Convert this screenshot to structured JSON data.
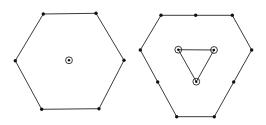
{
  "diagram": {
    "type": "graph-drawing",
    "colors": {
      "edge": "#3a3a3a",
      "vertex": "#111111",
      "background": "#ffffff"
    },
    "figures": [
      {
        "name": "hexagon-with-center",
        "outer_polygon": [
          [
            43.3,
            14
          ],
          [
            96,
            13.3
          ],
          [
            124,
            60.3
          ],
          [
            99,
            108.7
          ],
          [
            41.7,
            109.3
          ],
          [
            15.3,
            60.7
          ]
        ],
        "plain_vertices": [
          [
            43.3,
            14
          ],
          [
            96,
            13.3
          ],
          [
            124,
            60.3
          ],
          [
            99,
            108.7
          ],
          [
            41.7,
            109.3
          ],
          [
            15.3,
            60.7
          ]
        ],
        "ringed_vertices": [
          [
            69,
            60.3
          ]
        ],
        "inner_polygon": []
      },
      {
        "name": "hexagon-with-inner-triangle",
        "outer_polygon": [
          [
            161,
            15.3
          ],
          [
            232.3,
            15.3
          ],
          [
            251.7,
            50
          ],
          [
            214.3,
            116.7
          ],
          [
            176.7,
            116.7
          ],
          [
            140.3,
            50
          ]
        ],
        "plain_vertices": [
          [
            161,
            15.3
          ],
          [
            195.7,
            15.3
          ],
          [
            232.3,
            15.3
          ],
          [
            251.7,
            50
          ],
          [
            233.7,
            82
          ],
          [
            214.3,
            116.7
          ],
          [
            176.7,
            116.7
          ],
          [
            157.7,
            82
          ],
          [
            140.3,
            50
          ]
        ],
        "ringed_vertices": [
          [
            178.3,
            49.7
          ],
          [
            214,
            50
          ],
          [
            196.3,
            81.7
          ]
        ],
        "inner_polygon": [
          [
            178.3,
            49.7
          ],
          [
            214,
            50
          ],
          [
            196.3,
            81.7
          ]
        ]
      }
    ]
  }
}
